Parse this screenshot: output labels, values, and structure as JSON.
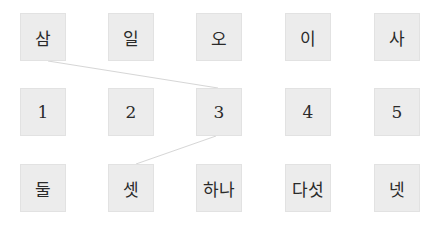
{
  "rows": [
    {
      "items": [
        "삼",
        "일",
        "오",
        "이",
        "사"
      ]
    },
    {
      "items": [
        "1",
        "2",
        "3",
        "4",
        "5"
      ]
    },
    {
      "items": [
        "둘",
        "셋",
        "하나",
        "다섯",
        "넷"
      ]
    }
  ],
  "connections": [
    {
      "from": "row0-item0",
      "to": "row1-item2",
      "from_label": "삼",
      "to_label": "3"
    },
    {
      "from": "row1-item2",
      "to": "row2-item1",
      "from_label": "3",
      "to_label": "셋"
    }
  ],
  "colors": {
    "box_fill": "#ececec",
    "line": "#d6d6d6",
    "text": "#2a2a2a"
  }
}
